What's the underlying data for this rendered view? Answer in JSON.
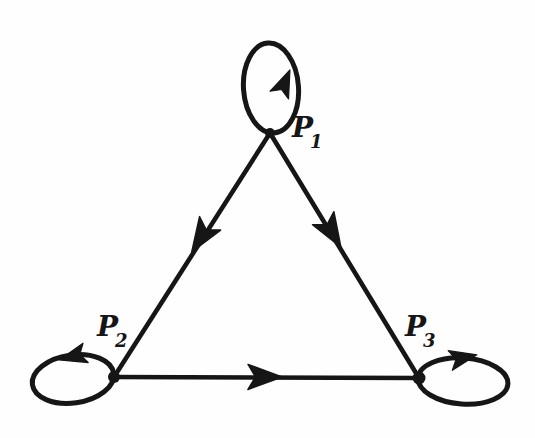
{
  "diagram": {
    "type": "directed-graph",
    "ink_color": "#161616",
    "background_color": "#fefefe",
    "nodes": [
      {
        "id": "P1",
        "label_base": "P",
        "label_sub": "1",
        "position": "top",
        "self_loop": true,
        "self_loop_arrow_direction": "up"
      },
      {
        "id": "P2",
        "label_base": "P",
        "label_sub": "2",
        "position": "bottom-left",
        "self_loop": true,
        "self_loop_arrow_direction": "left"
      },
      {
        "id": "P3",
        "label_base": "P",
        "label_sub": "3",
        "position": "bottom-right",
        "self_loop": true,
        "self_loop_arrow_direction": "right"
      }
    ],
    "edges": [
      {
        "from": "P1",
        "to": "P2",
        "directed": true,
        "arrow_position": "mid-edge"
      },
      {
        "from": "P1",
        "to": "P3",
        "directed": true,
        "arrow_position": "mid-edge"
      },
      {
        "from": "P2",
        "to": "P3",
        "directed": true,
        "arrow_position": "mid-edge"
      }
    ]
  }
}
